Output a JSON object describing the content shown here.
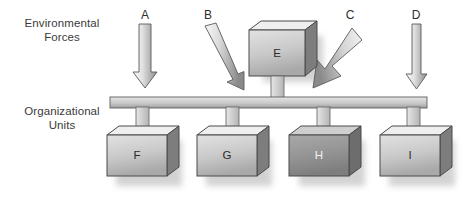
{
  "diagram": {
    "background_color": "#ffffff",
    "row_labels": {
      "top": "Environmental\nForces",
      "bottom": "Organizational\nUnits"
    },
    "colors": {
      "text": "#3a3a3a",
      "box_face_light": "#d8d8d8",
      "box_face_dark": "#9a9a9a",
      "box_face_h": "#8e8e8e",
      "box_top": "#f0f0f0",
      "box_side": "#7d7d7d",
      "outline": "#3f3f3f",
      "bar_face": "#d0d0d0",
      "bar_shade": "#8c8c8c",
      "arrow_light": "#f4f4f4",
      "arrow_dark": "#8d8d8d",
      "shadow": "#bdbdbd",
      "label_light": "#f2f2f2",
      "label_dark": "#2b2b2b"
    },
    "arrows": [
      {
        "id": "A",
        "label": "A",
        "direction": "down",
        "orientation": "vertical",
        "width": "medium",
        "label_x": 140,
        "label_y": 10
      },
      {
        "id": "B",
        "label": "B",
        "direction": "down-right",
        "orientation": "diagonal",
        "width": "medium",
        "label_x": 203,
        "label_y": 10
      },
      {
        "id": "C",
        "label": "C",
        "direction": "down-left",
        "orientation": "diagonal",
        "width": "thick",
        "label_x": 345,
        "label_y": 10
      },
      {
        "id": "D",
        "label": "D",
        "direction": "down",
        "orientation": "vertical",
        "width": "thin",
        "label_x": 411,
        "label_y": 10
      }
    ],
    "top_boxes": [
      {
        "id": "E",
        "label": "E",
        "label_color": "dark",
        "face": "light"
      }
    ],
    "bottom_boxes": [
      {
        "id": "F",
        "label": "F",
        "label_color": "dark",
        "face": "light"
      },
      {
        "id": "G",
        "label": "G",
        "label_color": "dark",
        "face": "light"
      },
      {
        "id": "H",
        "label": "H",
        "label_color": "light",
        "face": "dark"
      },
      {
        "id": "I",
        "label": "I",
        "label_color": "dark",
        "face": "light"
      }
    ],
    "bus": {
      "description": "horizontal connector bar linking organizational units",
      "x_start": 110,
      "x_end": 427,
      "y": 98
    }
  }
}
